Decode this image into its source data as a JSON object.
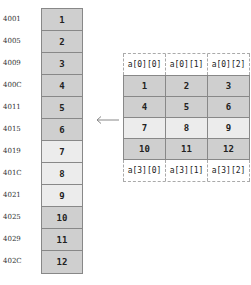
{
  "memory": {
    "addresses": [
      "4001",
      "4005",
      "4009",
      "400C",
      "4011",
      "4015",
      "4019",
      "401C",
      "4021",
      "4025",
      "4029",
      "402C"
    ],
    "values": [
      "1",
      "2",
      "3",
      "4",
      "5",
      "6",
      "7",
      "8",
      "9",
      "10",
      "11",
      "12"
    ],
    "shades": [
      "dark",
      "dark",
      "dark",
      "dark",
      "dark",
      "dark",
      "light",
      "light",
      "light",
      "dark",
      "dark",
      "dark"
    ]
  },
  "array": {
    "header_top": [
      "a[0][0]",
      "a[0][1]",
      "a[0][2]"
    ],
    "rows": [
      {
        "values": [
          "1",
          "2",
          "3"
        ],
        "shade": "dark"
      },
      {
        "values": [
          "4",
          "5",
          "6"
        ],
        "shade": "dark"
      },
      {
        "values": [
          "7",
          "8",
          "9"
        ],
        "shade": "light"
      },
      {
        "values": [
          "10",
          "11",
          "12"
        ],
        "shade": "dark"
      }
    ],
    "header_bottom": [
      "a[3][0]",
      "a[3][1]",
      "a[3][2]"
    ]
  },
  "arrow": {
    "direction": "left",
    "color": "#888888"
  },
  "colors": {
    "dark_cell": "#cfcfcf",
    "light_cell": "#ececec",
    "border": "#888888"
  }
}
